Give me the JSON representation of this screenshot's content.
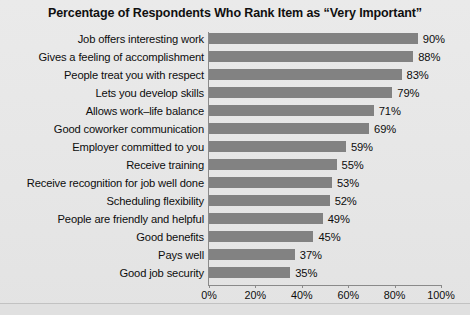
{
  "chart_data": {
    "type": "bar",
    "orientation": "horizontal",
    "title": "Percentage of Respondents Who Rank Item as “Very Important”",
    "xlabel": "",
    "ylabel": "",
    "xlim": [
      0,
      100
    ],
    "grid": false,
    "legend": null,
    "bar_color": "#828282",
    "background_color": "#e8e8e8",
    "tick_labels": [
      "0%",
      "20%",
      "40%",
      "60%",
      "80%",
      "100%"
    ],
    "tick_values": [
      0,
      20,
      40,
      60,
      80,
      100
    ],
    "categories": [
      "Job offers interesting work",
      "Gives a feeling of accomplishment",
      "People treat you with respect",
      "Lets you develop skills",
      "Allows work–life balance",
      "Good coworker communication",
      "Employer committed to you",
      "Receive training",
      "Receive recognition for job well done",
      "Scheduling flexibility",
      "People are friendly and helpful",
      "Good benefits",
      "Pays well",
      "Good job security"
    ],
    "values": [
      90,
      88,
      83,
      79,
      71,
      69,
      59,
      55,
      53,
      52,
      49,
      45,
      37,
      35
    ],
    "value_labels": [
      "90%",
      "88%",
      "83%",
      "79%",
      "71%",
      "69%",
      "59%",
      "55%",
      "53%",
      "52%",
      "49%",
      "45%",
      "37%",
      "35%"
    ]
  }
}
